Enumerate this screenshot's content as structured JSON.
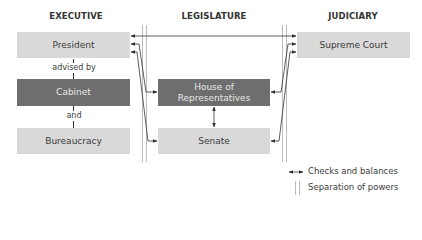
{
  "diagram": {
    "branches": [
      {
        "id": "executive",
        "heading": "EXECUTIVE"
      },
      {
        "id": "legislature",
        "heading": "LEGISLATURE"
      },
      {
        "id": "judiciary",
        "heading": "JUDICIARY"
      }
    ],
    "nodes": {
      "president": {
        "label": "President",
        "style": "light"
      },
      "cabinet": {
        "label": "Cabinet",
        "style": "dark"
      },
      "bureaucracy": {
        "label": "Bureaucracy",
        "style": "light"
      },
      "house": {
        "label": "House of Representatives",
        "line1": "House of",
        "line2": "Representatives",
        "style": "dark"
      },
      "senate": {
        "label": "Senate",
        "style": "light"
      },
      "supreme_court": {
        "label": "Supreme Court",
        "style": "light"
      }
    },
    "connectors": {
      "president_cabinet": "advised by",
      "cabinet_bureaucracy": "and"
    },
    "edges": [
      {
        "from": "president",
        "to": "supreme_court",
        "type": "checks-and-balances"
      },
      {
        "from": "president",
        "to": "house",
        "type": "checks-and-balances"
      },
      {
        "from": "president",
        "to": "senate",
        "type": "checks-and-balances"
      },
      {
        "from": "supreme_court",
        "to": "house",
        "type": "checks-and-balances"
      },
      {
        "from": "supreme_court",
        "to": "senate",
        "type": "checks-and-balances"
      },
      {
        "from": "house",
        "to": "senate",
        "type": "checks-and-balances"
      }
    ],
    "legend": {
      "checks": "Checks and balances",
      "separation": "Separation of powers"
    },
    "colors": {
      "light_box": "#d9d9d9",
      "dark_box": "#6e6e6e",
      "separator": "#bcbcbc",
      "arrow": "#333333"
    }
  }
}
